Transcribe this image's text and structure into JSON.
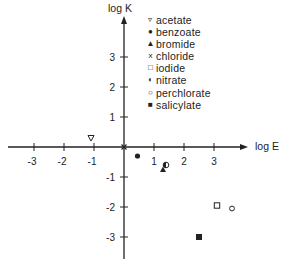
{
  "chart_data": {
    "type": "scatter",
    "title": "",
    "xlabel": "log E",
    "ylabel": "log K",
    "xlim": [
      -3.7,
      3.9
    ],
    "ylim": [
      -3.5,
      4.3
    ],
    "x_ticks": [
      -3,
      -2,
      -1,
      1,
      2,
      3
    ],
    "y_ticks": [
      3,
      2,
      1,
      -1,
      -2,
      -3
    ],
    "x_tick_labels": [
      "-3",
      "-2",
      "-1",
      "1",
      "2",
      "3"
    ],
    "y_tick_labels": [
      "3",
      "2",
      "1",
      "-1",
      "-2",
      "-3"
    ],
    "grid": false,
    "legend_position": "upper right",
    "series": [
      {
        "name": "acetate",
        "marker": "triangle-down-open",
        "x": -1.1,
        "y": 0.3
      },
      {
        "name": "benzoate",
        "marker": "circle-filled",
        "x": 0.45,
        "y": -0.3
      },
      {
        "name": "bromide",
        "marker": "triangle-up-filled",
        "x": 1.3,
        "y": -0.75
      },
      {
        "name": "chloride",
        "marker": "x",
        "x": 0.0,
        "y": 0.0
      },
      {
        "name": "iodide",
        "marker": "square-open",
        "x": 3.1,
        "y": -1.95
      },
      {
        "name": "nitrate",
        "marker": "circle-half",
        "x": 1.4,
        "y": -0.6
      },
      {
        "name": "perchlorate",
        "marker": "circle-open",
        "x": 3.6,
        "y": -2.05
      },
      {
        "name": "salicylate",
        "marker": "square-filled",
        "x": 2.5,
        "y": -3.0
      }
    ]
  },
  "legend": {
    "items": [
      {
        "symbol": "▿",
        "label": "acetate"
      },
      {
        "symbol": "●",
        "label": "benzoate"
      },
      {
        "symbol": "▲",
        "label": "bromide"
      },
      {
        "symbol": "x",
        "label": "chloride"
      },
      {
        "symbol": "□",
        "label": "iodide"
      },
      {
        "symbol": "◐",
        "label": "nitrate"
      },
      {
        "symbol": "○",
        "label": "perchlorate"
      },
      {
        "symbol": "■",
        "label": "salicylate"
      }
    ]
  },
  "axes": {
    "x_label": "log E",
    "y_label": "log K"
  },
  "colors": {
    "ink": "#222222",
    "background": "#ffffff"
  }
}
